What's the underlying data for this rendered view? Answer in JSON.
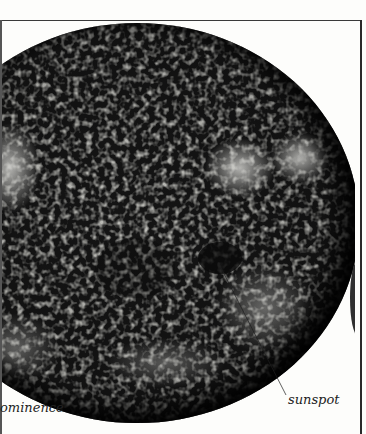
{
  "figure": {
    "labels": {
      "sunspot": "sunspot",
      "prominence_partial": "ominence"
    },
    "colors": {
      "background": "#fdfdfb",
      "disc_dark": "#141414",
      "disc_light": "#c8c8c4",
      "rule": "#2a2a2a",
      "label_text": "#222222"
    }
  }
}
